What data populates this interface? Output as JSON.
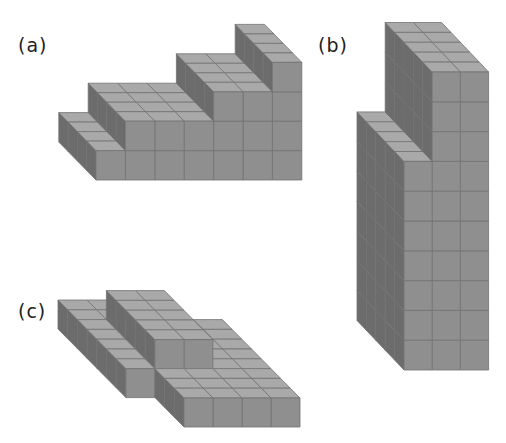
{
  "colors": {
    "background": "#ffffff",
    "top_face": "#a9a9a9",
    "front_face": "#8f8f8f",
    "side_face": "#6c6c6c",
    "grid_line": "#727272",
    "label": "#222222"
  },
  "figures": [
    {
      "id": "a",
      "label": "(a)",
      "label_pos": [
        18,
        34
      ],
      "description": "staircase of unit cubes, 7 columns wide, 4 rows deep, heights 1,2,2,2,3,3,4",
      "origin": [
        96,
        180
      ],
      "cube_w": 29.4,
      "cube_h": 29.4,
      "depth_step": [
        -9.3,
        -9.5
      ],
      "columns": 7,
      "rows": 4,
      "heights_by_column": [
        1,
        2,
        2,
        2,
        3,
        3,
        4
      ]
    },
    {
      "id": "b",
      "label": "(b)",
      "label_pos": [
        318,
        34
      ],
      "description": "tall tower, 3 columns wide, 5 rows deep, heights 7,10,10",
      "origin": [
        404,
        370
      ],
      "cube_w": 28.2,
      "cube_h": 29.8,
      "depth_step": [
        -9.4,
        -9.9
      ],
      "columns": 3,
      "rows": 5,
      "heights_by_column": [
        7,
        10,
        10
      ]
    },
    {
      "id": "c",
      "label": "(c)",
      "label_pos": [
        18,
        300
      ],
      "description": "flat L-shaped slab with a raised 2x5 block on top",
      "origin": [
        126,
        427
      ],
      "cube_w": 29,
      "cube_h": 29,
      "depth_step": [
        -9.7,
        -9.8
      ],
      "voxels_boxes": [
        {
          "c": [
            1,
            1
          ],
          "r": [
            3,
            9
          ],
          "h": [
            0,
            0
          ]
        },
        {
          "c": [
            2,
            5
          ],
          "r": [
            0,
            7
          ],
          "h": [
            0,
            0
          ]
        },
        {
          "c": [
            2,
            2
          ],
          "r": [
            8,
            9
          ],
          "h": [
            0,
            0
          ]
        },
        {
          "c": [
            2,
            3
          ],
          "r": [
            3,
            7
          ],
          "h": [
            1,
            1
          ]
        }
      ]
    }
  ]
}
